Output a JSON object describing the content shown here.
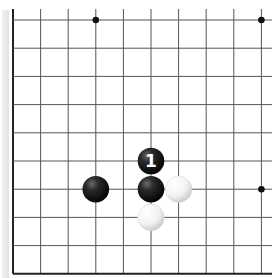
{
  "board": {
    "type": "go-board-fragment",
    "visible_corner": "bottom-left",
    "columns": 10,
    "rows": 10,
    "colors": {
      "background": "#ffffff",
      "grid_line": "#555555",
      "edge_line": "#222222",
      "black_stone": "#1a1a1a",
      "white_stone": "#f4f4f4",
      "label_on_black": "#ffffff"
    },
    "star_points": [
      {
        "col": 3,
        "row": 0
      },
      {
        "col": 9,
        "row": 0
      },
      {
        "col": 9,
        "row": 6
      }
    ],
    "stones": [
      {
        "color": "black",
        "col": 5,
        "row": 5,
        "label": "1"
      },
      {
        "color": "black",
        "col": 5,
        "row": 6,
        "label": ""
      },
      {
        "color": "black",
        "col": 3,
        "row": 6,
        "label": ""
      },
      {
        "color": "white",
        "col": 6,
        "row": 6,
        "label": ""
      },
      {
        "color": "white",
        "col": 5,
        "row": 7,
        "label": ""
      }
    ]
  }
}
